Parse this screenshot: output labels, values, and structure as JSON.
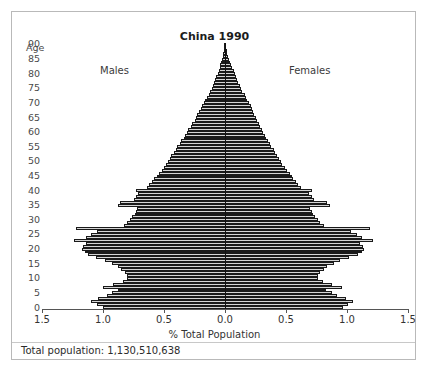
{
  "chart_data": {
    "type": "bar",
    "subtype": "population-pyramid",
    "title": "China 1990",
    "xlabel": "% Total Population",
    "ylabel": "Age",
    "left_series_label": "Males",
    "right_series_label": "Females",
    "xlim": [
      -1.5,
      1.5
    ],
    "ylim": [
      0,
      90
    ],
    "xticks": [
      -1.5,
      -1.0,
      -0.5,
      0.0,
      0.5,
      1.0,
      1.5
    ],
    "xtick_labels": [
      "1.5",
      "1.0",
      "0.5",
      "0.0",
      "0.5",
      "1.0",
      "1.5"
    ],
    "yticks": [
      0,
      5,
      10,
      15,
      20,
      25,
      30,
      35,
      40,
      45,
      50,
      55,
      60,
      65,
      70,
      75,
      80,
      85,
      90
    ],
    "ytick_labels": [
      "0",
      "5",
      "10",
      "15",
      "20",
      "25",
      "30",
      "35",
      "40",
      "45",
      "50",
      "55",
      "60",
      "65",
      "70",
      "75",
      "80",
      "85",
      "90"
    ],
    "grid": false,
    "legend_position": "inline-top",
    "footnote": "Total population: 1,130,510,638",
    "total_population": "1,130,510,638",
    "units": "percent of total population",
    "age_bin_width": 1,
    "ages": [
      0,
      1,
      2,
      3,
      4,
      5,
      6,
      7,
      8,
      9,
      10,
      11,
      12,
      13,
      14,
      15,
      16,
      17,
      18,
      19,
      20,
      21,
      22,
      23,
      24,
      25,
      26,
      27,
      28,
      29,
      30,
      31,
      32,
      33,
      34,
      35,
      36,
      37,
      38,
      39,
      40,
      41,
      42,
      43,
      44,
      45,
      46,
      47,
      48,
      49,
      50,
      51,
      52,
      53,
      54,
      55,
      56,
      57,
      58,
      59,
      60,
      61,
      62,
      63,
      64,
      65,
      66,
      67,
      68,
      69,
      70,
      71,
      72,
      73,
      74,
      75,
      76,
      77,
      78,
      79,
      80,
      81,
      82,
      83,
      84,
      85,
      86,
      87,
      88,
      89,
      90
    ],
    "series": [
      {
        "name": "Males",
        "side": "left",
        "values": [
          1.0,
          1.05,
          1.1,
          1.04,
          0.97,
          0.93,
          0.88,
          1.0,
          0.92,
          0.84,
          0.8,
          0.8,
          0.82,
          0.85,
          0.88,
          0.93,
          0.98,
          1.06,
          1.12,
          1.15,
          1.17,
          1.16,
          1.14,
          1.24,
          1.14,
          1.1,
          1.05,
          1.22,
          0.83,
          0.8,
          0.78,
          0.76,
          0.74,
          0.73,
          0.72,
          0.88,
          0.86,
          0.75,
          0.73,
          0.71,
          0.73,
          0.64,
          0.62,
          0.6,
          0.58,
          0.56,
          0.54,
          0.52,
          0.5,
          0.48,
          0.47,
          0.45,
          0.44,
          0.42,
          0.4,
          0.39,
          0.37,
          0.36,
          0.34,
          0.33,
          0.31,
          0.3,
          0.28,
          0.27,
          0.25,
          0.24,
          0.23,
          0.21,
          0.2,
          0.19,
          0.17,
          0.16,
          0.15,
          0.13,
          0.12,
          0.11,
          0.1,
          0.09,
          0.08,
          0.07,
          0.06,
          0.05,
          0.045,
          0.038,
          0.031,
          0.025,
          0.02,
          0.015,
          0.011,
          0.008,
          0.005
        ]
      },
      {
        "name": "Females",
        "side": "right",
        "values": [
          0.97,
          1.01,
          1.05,
          0.99,
          0.92,
          0.88,
          0.83,
          0.96,
          0.88,
          0.8,
          0.76,
          0.76,
          0.78,
          0.81,
          0.84,
          0.89,
          0.94,
          1.02,
          1.09,
          1.12,
          1.14,
          1.13,
          1.11,
          1.21,
          1.12,
          1.08,
          1.03,
          1.19,
          0.81,
          0.78,
          0.76,
          0.74,
          0.72,
          0.71,
          0.7,
          0.86,
          0.84,
          0.73,
          0.71,
          0.69,
          0.71,
          0.62,
          0.6,
          0.58,
          0.56,
          0.55,
          0.53,
          0.51,
          0.49,
          0.47,
          0.46,
          0.44,
          0.43,
          0.41,
          0.4,
          0.38,
          0.37,
          0.35,
          0.34,
          0.33,
          0.31,
          0.3,
          0.29,
          0.28,
          0.26,
          0.25,
          0.24,
          0.23,
          0.22,
          0.21,
          0.2,
          0.18,
          0.17,
          0.16,
          0.14,
          0.13,
          0.12,
          0.11,
          0.1,
          0.09,
          0.08,
          0.07,
          0.06,
          0.05,
          0.041,
          0.033,
          0.026,
          0.02,
          0.015,
          0.01,
          0.006
        ]
      }
    ]
  },
  "figure": {
    "title": "China 1990",
    "age_caption": "Age",
    "males_label": "Males",
    "females_label": "Females",
    "x_axis_title": "% Total Population",
    "footnote": "Total population: 1,130,510,638"
  },
  "colors": {
    "bar_fill": "#d5d5d5",
    "bar_edge": "#1a1a1a",
    "axis": "#555555",
    "center_line": "#111111",
    "border": "#b9b9b9",
    "text": "#333333"
  }
}
